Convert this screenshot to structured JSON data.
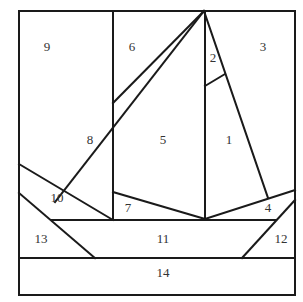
{
  "diagram": {
    "colors": {
      "line": "#1a1a1a",
      "label": "#333333",
      "background": "#ffffff"
    },
    "pieces": [
      {
        "id": "1",
        "label": "1",
        "x": 229,
        "y": 141
      },
      {
        "id": "2",
        "label": "2",
        "x": 213,
        "y": 59
      },
      {
        "id": "3",
        "label": "3",
        "x": 263,
        "y": 48
      },
      {
        "id": "4",
        "label": "4",
        "x": 268,
        "y": 209
      },
      {
        "id": "5",
        "label": "5",
        "x": 163,
        "y": 141
      },
      {
        "id": "6",
        "label": "6",
        "x": 132,
        "y": 48
      },
      {
        "id": "7",
        "label": "7",
        "x": 128,
        "y": 209
      },
      {
        "id": "8",
        "label": "8",
        "x": 90,
        "y": 141
      },
      {
        "id": "9",
        "label": "9",
        "x": 47,
        "y": 48
      },
      {
        "id": "10",
        "label": "10",
        "x": 57,
        "y": 199
      },
      {
        "id": "11",
        "label": "11",
        "x": 163,
        "y": 240
      },
      {
        "id": "12",
        "label": "12",
        "x": 281,
        "y": 240
      },
      {
        "id": "13",
        "label": "13",
        "x": 41,
        "y": 240
      },
      {
        "id": "14",
        "label": "14",
        "x": 163,
        "y": 274
      }
    ]
  }
}
